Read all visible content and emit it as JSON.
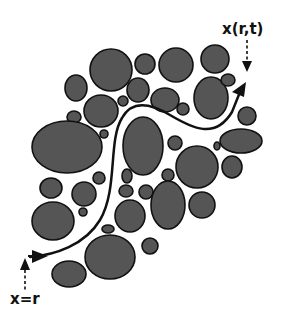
{
  "diagram": {
    "type": "particle-trajectory",
    "labels": {
      "end": "x(r,t)",
      "start": "x=r"
    },
    "colors": {
      "particle_fill": "#555555",
      "particle_stroke": "#111111",
      "path": "#111111",
      "background": "#ffffff"
    },
    "particles": [
      {
        "cx": 111,
        "cy": 70,
        "rx": 21,
        "ry": 21
      },
      {
        "cx": 145,
        "cy": 64,
        "rx": 10,
        "ry": 10
      },
      {
        "cx": 176,
        "cy": 65,
        "rx": 17,
        "ry": 17
      },
      {
        "cx": 215,
        "cy": 59,
        "rx": 14,
        "ry": 14
      },
      {
        "cx": 76,
        "cy": 88,
        "rx": 11,
        "ry": 13
      },
      {
        "cx": 138,
        "cy": 90,
        "rx": 11,
        "ry": 12
      },
      {
        "cx": 165,
        "cy": 100,
        "rx": 14,
        "ry": 12
      },
      {
        "cx": 211,
        "cy": 98,
        "rx": 17,
        "ry": 21
      },
      {
        "cx": 228,
        "cy": 80,
        "rx": 7,
        "ry": 6
      },
      {
        "cx": 101,
        "cy": 111,
        "rx": 17,
        "ry": 16
      },
      {
        "cx": 123,
        "cy": 101,
        "rx": 5,
        "ry": 5
      },
      {
        "cx": 183,
        "cy": 109,
        "rx": 6,
        "ry": 6
      },
      {
        "cx": 74,
        "cy": 117,
        "rx": 7,
        "ry": 6
      },
      {
        "cx": 247,
        "cy": 116,
        "rx": 9,
        "ry": 9
      },
      {
        "cx": 67,
        "cy": 147,
        "rx": 35,
        "ry": 26
      },
      {
        "cx": 104,
        "cy": 134,
        "rx": 4,
        "ry": 4
      },
      {
        "cx": 143,
        "cy": 146,
        "rx": 20,
        "ry": 29
      },
      {
        "cx": 175,
        "cy": 143,
        "rx": 7,
        "ry": 7
      },
      {
        "cx": 241,
        "cy": 141,
        "rx": 21,
        "ry": 12
      },
      {
        "cx": 217,
        "cy": 146,
        "rx": 3,
        "ry": 4
      },
      {
        "cx": 197,
        "cy": 167,
        "rx": 21,
        "ry": 21
      },
      {
        "cx": 232,
        "cy": 167,
        "rx": 10,
        "ry": 11
      },
      {
        "cx": 51,
        "cy": 188,
        "rx": 11,
        "ry": 10
      },
      {
        "cx": 84,
        "cy": 194,
        "rx": 12,
        "ry": 12
      },
      {
        "cx": 99,
        "cy": 178,
        "rx": 6,
        "ry": 6
      },
      {
        "cx": 127,
        "cy": 176,
        "rx": 5,
        "ry": 7
      },
      {
        "cx": 168,
        "cy": 175,
        "rx": 6,
        "ry": 6
      },
      {
        "cx": 126,
        "cy": 191,
        "rx": 7,
        "ry": 6
      },
      {
        "cx": 146,
        "cy": 192,
        "rx": 7,
        "ry": 7
      },
      {
        "cx": 53,
        "cy": 221,
        "rx": 21,
        "ry": 19
      },
      {
        "cx": 83,
        "cy": 212,
        "rx": 4,
        "ry": 4
      },
      {
        "cx": 130,
        "cy": 216,
        "rx": 15,
        "ry": 16
      },
      {
        "cx": 168,
        "cy": 205,
        "rx": 17,
        "ry": 24
      },
      {
        "cx": 202,
        "cy": 205,
        "rx": 13,
        "ry": 13
      },
      {
        "cx": 108,
        "cy": 229,
        "rx": 6,
        "ry": 4
      },
      {
        "cx": 110,
        "cy": 257,
        "rx": 25,
        "ry": 22
      },
      {
        "cx": 150,
        "cy": 246,
        "rx": 8,
        "ry": 8
      },
      {
        "cx": 69,
        "cy": 274,
        "rx": 17,
        "ry": 13
      }
    ],
    "path_d": "M 30 257 C 55 255, 85 245, 100 220 C 118 190, 108 140, 122 118 C 132 100, 150 103, 170 115 C 192 128, 215 140, 232 112 L 240 92"
  }
}
